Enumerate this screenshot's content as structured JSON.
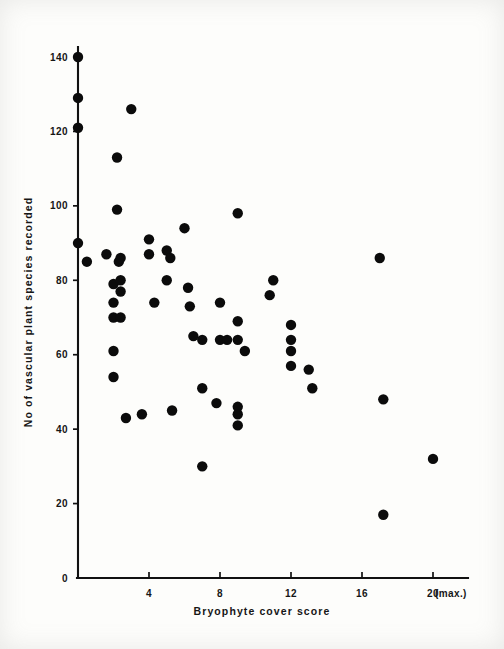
{
  "figure": {
    "title": "",
    "background_color": "#fdfdfb",
    "ink_color": "#0b0b0b"
  },
  "axes": {
    "x_title": "Bryophyte  cover  score",
    "y_title": "No of vascular plant species recorded",
    "x_ticks": [
      "4",
      "8",
      "12",
      "16",
      "20"
    ],
    "x_max_note": "(max.)",
    "y_ticks": [
      "0",
      "20",
      "40",
      "60",
      "80",
      "100",
      "120",
      "140"
    ]
  },
  "chart_data": {
    "type": "scatter",
    "title": "",
    "xlabel": "Bryophyte cover score",
    "ylabel": "No of vascular plant species recorded",
    "xlim": [
      0,
      21
    ],
    "ylim": [
      0,
      145
    ],
    "xticks": [
      4,
      8,
      12,
      16,
      20
    ],
    "yticks": [
      0,
      20,
      40,
      60,
      80,
      100,
      120,
      140
    ],
    "grid": false,
    "legend": null,
    "marker": "filled-circle",
    "marker_color": "#0b0b0b",
    "n_points": 57,
    "points": [
      [
        0.0,
        140
      ],
      [
        0.0,
        129
      ],
      [
        0.0,
        121
      ],
      [
        0.0,
        90
      ],
      [
        0.5,
        85
      ],
      [
        1.6,
        87
      ],
      [
        2.0,
        79
      ],
      [
        2.0,
        74
      ],
      [
        2.0,
        70
      ],
      [
        2.0,
        61
      ],
      [
        2.0,
        54
      ],
      [
        2.2,
        113
      ],
      [
        2.2,
        99
      ],
      [
        2.3,
        85
      ],
      [
        2.4,
        86
      ],
      [
        2.4,
        80
      ],
      [
        2.4,
        77
      ],
      [
        2.4,
        70
      ],
      [
        2.7,
        43
      ],
      [
        3.0,
        126
      ],
      [
        3.6,
        44
      ],
      [
        4.0,
        91
      ],
      [
        4.0,
        87
      ],
      [
        4.3,
        74
      ],
      [
        5.0,
        80
      ],
      [
        5.0,
        88
      ],
      [
        5.2,
        86
      ],
      [
        5.3,
        45
      ],
      [
        6.0,
        94
      ],
      [
        6.2,
        78
      ],
      [
        6.3,
        73
      ],
      [
        6.5,
        65
      ],
      [
        7.0,
        64
      ],
      [
        7.0,
        51
      ],
      [
        7.0,
        30
      ],
      [
        7.8,
        47
      ],
      [
        8.0,
        74
      ],
      [
        8.0,
        64
      ],
      [
        8.4,
        64
      ],
      [
        9.0,
        98
      ],
      [
        9.0,
        69
      ],
      [
        9.0,
        64
      ],
      [
        9.0,
        46
      ],
      [
        9.0,
        44
      ],
      [
        9.0,
        41
      ],
      [
        9.4,
        61
      ],
      [
        10.8,
        76
      ],
      [
        11.0,
        80
      ],
      [
        12.0,
        68
      ],
      [
        12.0,
        64
      ],
      [
        12.0,
        61
      ],
      [
        12.0,
        57
      ],
      [
        13.0,
        56
      ],
      [
        13.2,
        51
      ],
      [
        17.0,
        86
      ],
      [
        17.2,
        48
      ],
      [
        17.2,
        17
      ],
      [
        20.0,
        32
      ]
    ]
  }
}
